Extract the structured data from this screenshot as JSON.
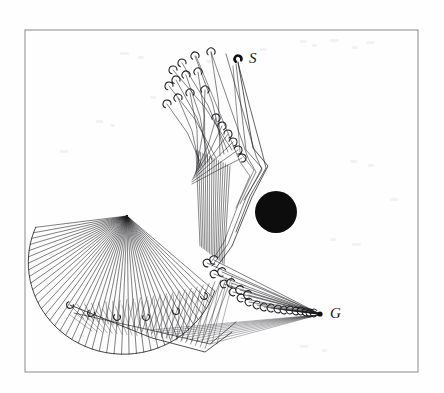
{
  "figure": {
    "domain": "scientific-figure",
    "kind": "motion-planning-trajectory-diagram",
    "background_color": "#fefefe",
    "ink_color": "#1a1a1d",
    "frame": {
      "name": "figure-border",
      "x": 25,
      "y": 30,
      "width": 393,
      "height": 342,
      "stroke": "#8a8a90",
      "stroke_width": 1
    },
    "labels": [
      {
        "id": "start",
        "text": "S",
        "x": 249,
        "y": 63,
        "style": "italic-serif"
      },
      {
        "id": "goal",
        "text": "G",
        "x": 330,
        "y": 318,
        "style": "italic-serif"
      }
    ],
    "nodes": [
      {
        "id": "start-node",
        "label": "S",
        "x": 238,
        "y": 59,
        "marker": "hook",
        "rotation": -105
      },
      {
        "id": "goal-node",
        "label": "G",
        "x": 320,
        "y": 314,
        "marker": "dot",
        "radius": 2.6
      }
    ],
    "obstacle": {
      "name": "circular-obstacle",
      "shape": "circle",
      "cx": 276,
      "cy": 212,
      "r": 21,
      "fill": "#0d0d0d"
    },
    "fan_apex": {
      "x": 127,
      "y": 216
    },
    "lower_vertex": {
      "x": 70,
      "y": 305
    },
    "bend_vertex": {
      "x": 256,
      "y": 160
    },
    "marker_style": {
      "name": "gripper-hook",
      "description": "small open c-shaped hook drawn at the free end of each trajectory",
      "size": 4.2,
      "stroke": "#1f1f22",
      "stroke_width": 1.05
    },
    "trees": [
      {
        "id": "start-tree",
        "root": "start-node",
        "color": "#1a1a1d",
        "stroke_width": 0.75,
        "description": "trajectories emanating downward-left from S, bending at a vertex and fanning to hook endpoints in the upper-left",
        "branch_count": 26
      },
      {
        "id": "goal-tree",
        "root": "goal-node",
        "color": "#1a1a1d",
        "stroke_width": 0.75,
        "description": "trajectories emanating upper-left from G, fanning into hook endpoints along the lower-middle band",
        "branch_count": 24
      },
      {
        "id": "sweep-fan",
        "root": "fan_apex",
        "color": "#1a1a1d",
        "stroke_width": 0.7,
        "description": "dense radial fan sweeping from the apex down and to the left, forming the large lobe",
        "branch_count": 42
      },
      {
        "id": "lower-lattice",
        "root": "lower_vertex",
        "color": "#2a2a2e",
        "stroke_width": 0.6,
        "description": "crossing lines forming a lattice along the lower boundary of the lobe",
        "branch_count": 30
      }
    ],
    "chart_data": {
      "type": "scatter",
      "title": "",
      "xlabel": "",
      "ylabel": "",
      "grid": false,
      "legend": "none",
      "xlim": [
        25,
        418
      ],
      "ylim": [
        30,
        372
      ],
      "annotations": [
        "S",
        "G"
      ],
      "series": [
        {
          "name": "start-tree-endpoints",
          "x": [
            173,
            182,
            195,
            211,
            169,
            176,
            186,
            198,
            167,
            178,
            190,
            205,
            216,
            222,
            228,
            233,
            238,
            242
          ],
          "y": [
            70,
            63,
            56,
            52,
            86,
            80,
            75,
            72,
            104,
            98,
            93,
            90,
            118,
            126,
            134,
            142,
            150,
            158
          ]
        },
        {
          "name": "goal-tree-endpoints",
          "x": [
            207,
            214,
            224,
            233,
            241,
            249,
            257,
            264,
            271,
            278,
            284,
            290,
            296,
            301,
            306,
            310,
            314
          ],
          "y": [
            263,
            274,
            284,
            292,
            298,
            302,
            305,
            307,
            308,
            309,
            310,
            310,
            311,
            311,
            312,
            313,
            313
          ]
        },
        {
          "name": "fan-endpoints",
          "x": [
            70,
            76,
            83,
            91,
            99,
            108,
            117,
            126,
            136,
            146,
            156,
            166,
            176,
            186,
            196,
            204,
            211,
            217
          ],
          "y": [
            305,
            308,
            311,
            313,
            315,
            316,
            317,
            318,
            318,
            317,
            316,
            314,
            311,
            307,
            302,
            296,
            289,
            281
          ]
        }
      ],
      "obstacle_points": [
        {
          "x": 276,
          "y": 212,
          "r": 21
        }
      ],
      "special_points": [
        {
          "label": "S",
          "x": 238,
          "y": 59
        },
        {
          "label": "G",
          "x": 320,
          "y": 314
        }
      ]
    }
  }
}
